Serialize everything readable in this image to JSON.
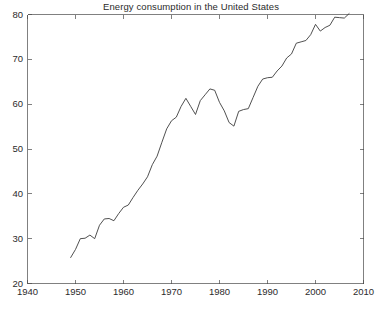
{
  "chart_data": {
    "type": "line",
    "title": "Energy consumption in the United States",
    "xlabel": "",
    "ylabel": "",
    "xlim": [
      1940,
      2010
    ],
    "ylim": [
      20,
      80
    ],
    "xticks": [
      1940,
      1950,
      1960,
      1970,
      1980,
      1990,
      2000,
      2010
    ],
    "yticks": [
      20,
      30,
      40,
      50,
      60,
      70,
      80
    ],
    "xtick_labels": [
      "1940",
      "1950",
      "1960",
      "1970",
      "1980",
      "1990",
      "2000",
      "2010"
    ],
    "ytick_labels": [
      "20",
      "30",
      "40",
      "50",
      "60",
      "70",
      "80"
    ],
    "grid": false,
    "legend": null,
    "legend_position": "none",
    "line_color": "#3c3c3c",
    "axis_color": "#4a4a4a",
    "background_color": "#ffffff",
    "series": [
      {
        "name": "Energy consumption",
        "x": [
          1949,
          1950,
          1951,
          1952,
          1953,
          1954,
          1955,
          1956,
          1957,
          1958,
          1959,
          1960,
          1961,
          1962,
          1963,
          1964,
          1965,
          1966,
          1967,
          1968,
          1969,
          1970,
          1971,
          1972,
          1973,
          1974,
          1975,
          1976,
          1977,
          1978,
          1979,
          1980,
          1981,
          1982,
          1983,
          1984,
          1985,
          1986,
          1987,
          1988,
          1989,
          1990,
          1991,
          1992,
          1993,
          1994,
          1995,
          1996,
          1997,
          1998,
          1999,
          2000,
          2001,
          2002,
          2003,
          2004,
          2005,
          2006,
          2007
        ],
        "values": [
          25.8,
          27.6,
          30.0,
          30.1,
          30.8,
          30.0,
          33.0,
          34.4,
          34.5,
          34.0,
          35.6,
          37.0,
          37.5,
          39.2,
          40.8,
          42.2,
          43.8,
          46.5,
          48.4,
          51.5,
          54.5,
          56.3,
          57.1,
          59.5,
          61.3,
          59.5,
          57.7,
          60.8,
          62.1,
          63.4,
          63.1,
          60.4,
          58.5,
          55.9,
          55.1,
          58.4,
          58.8,
          59.0,
          61.5,
          64.0,
          65.6,
          65.9,
          66.0,
          67.4,
          68.5,
          70.3,
          71.2,
          73.6,
          73.9,
          74.2,
          75.5,
          77.8,
          76.3,
          77.1,
          77.6,
          79.4,
          79.3,
          79.2,
          80.2
        ]
      }
    ]
  },
  "axes": {
    "x_label_1940": "1940",
    "x_label_1950": "1950",
    "x_label_1960": "1960",
    "x_label_1970": "1970",
    "x_label_1980": "1980",
    "x_label_1990": "1990",
    "x_label_2000": "2000",
    "x_label_2010": "2010",
    "y_label_20": "20",
    "y_label_30": "30",
    "y_label_40": "40",
    "y_label_50": "50",
    "y_label_60": "60",
    "y_label_70": "70",
    "y_label_80": "80"
  }
}
